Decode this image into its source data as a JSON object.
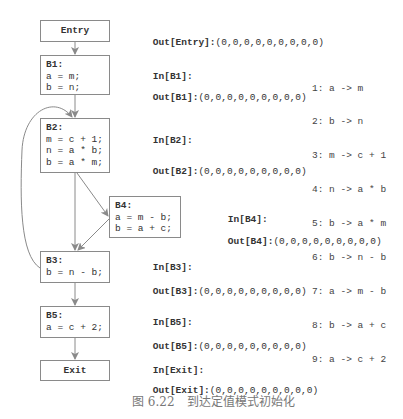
{
  "blocks": {
    "entry": {
      "label": "Entry"
    },
    "b1": {
      "title": "B1:",
      "lines": [
        "a = m;",
        "b = n;"
      ]
    },
    "b2": {
      "title": "B2:",
      "lines": [
        "m = c + 1;",
        "n = a * b;",
        "b = a * m;"
      ]
    },
    "b4": {
      "title": "B4:",
      "lines": [
        "a = m - b;",
        "b = a + c;"
      ]
    },
    "b3": {
      "title": "B3:",
      "lines": [
        "b = n - b;"
      ]
    },
    "b5": {
      "title": "B5:",
      "lines": [
        "a = c + 2;"
      ]
    },
    "exit": {
      "label": "Exit"
    }
  },
  "annotations": {
    "out_entry": {
      "label": "Out[Entry]:",
      "value": "(0,0,0,0,0,0,0,0,0)"
    },
    "in_b1": {
      "label": "In[B1]:",
      "value": ""
    },
    "out_b1": {
      "label": "Out[B1]:",
      "value": "(0,0,0,0,0,0,0,0,0)"
    },
    "in_b2": {
      "label": "In[B2]:",
      "value": ""
    },
    "out_b2": {
      "label": "Out[B2]:",
      "value": "(0,0,0,0,0,0,0,0,0)"
    },
    "in_b4": {
      "label": "In[B4]:",
      "value": ""
    },
    "out_b4": {
      "label": "Out[B4]:",
      "value": "(0,0,0,0,0,0,0,0,0)"
    },
    "in_b3": {
      "label": "In[B3]:",
      "value": ""
    },
    "out_b3": {
      "label": "Out[B3]:",
      "value": "(0,0,0,0,0,0,0,0,0)"
    },
    "in_b5": {
      "label": "In[B5]:",
      "value": ""
    },
    "out_b5": {
      "label": "Out[B5]:",
      "value": "(0,0,0,0,0,0,0,0,0)"
    },
    "in_exit": {
      "label": "In[Exit]:",
      "value": ""
    },
    "out_exit": {
      "label": "Out[Exit]:",
      "value": "(0,0,0,0,0,0,0,0,0)"
    }
  },
  "definitions": [
    "1: a -> m",
    "2: b -> n",
    "3: m -> c + 1",
    "4: n -> a * b",
    "5: b -> a * m",
    "6: b -> n - b",
    "7: a -> m - b",
    "8: b -> a + c",
    "9: a -> c + 2"
  ],
  "caption": "图 6.22　到达定值模式初始化",
  "colors": {
    "edge": "#8a8a8a",
    "text": "#333333",
    "caption": "#777777"
  }
}
